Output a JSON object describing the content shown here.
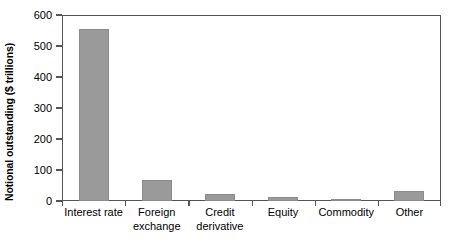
{
  "chart_data": {
    "type": "bar",
    "title": "",
    "subtitle": "",
    "xlabel": "",
    "ylabel": "Notional outstanding ($ trillions)",
    "categories": [
      "Interest rate",
      "Foreign exchange",
      "Credit derivative",
      "Equity",
      "Commodity",
      "Other"
    ],
    "category_lines": [
      [
        "Interest rate"
      ],
      [
        "Foreign",
        "exchange"
      ],
      [
        "Credit",
        "derivative"
      ],
      [
        "Equity"
      ],
      [
        "Commodity"
      ],
      [
        "Other"
      ]
    ],
    "values": [
      555,
      68,
      23,
      13,
      3,
      32
    ],
    "series": [
      {
        "name": "Notional outstanding",
        "values": [
          555,
          68,
          23,
          13,
          3,
          32
        ]
      }
    ],
    "ylim": [
      0,
      600
    ],
    "yticks": [
      0,
      100,
      200,
      300,
      400,
      500,
      600
    ],
    "ytick_labels": [
      "0",
      "100",
      "200",
      "300",
      "400",
      "500",
      "600"
    ],
    "grid": false,
    "legend": false,
    "legend_position": "none",
    "bar_color": "#9a9a9a",
    "bar_edge_color": "#8c8c8c",
    "axis_color": "#555555",
    "background_color": "#ffffff",
    "annotations": []
  }
}
